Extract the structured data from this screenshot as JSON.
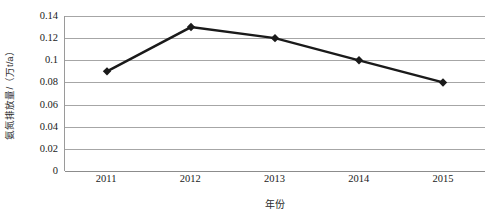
{
  "chart_data": {
    "type": "line",
    "title": "",
    "categories": [
      "2011",
      "2012",
      "2013",
      "2014",
      "2015"
    ],
    "values": [
      0.09,
      0.13,
      0.12,
      0.1,
      0.08
    ],
    "series": [
      {
        "name": "氨氮排放量",
        "values": [
          0.09,
          0.13,
          0.12,
          0.1,
          0.08
        ]
      }
    ],
    "xlabel": "年份",
    "ylabel": "氨氮排放量/（万t/a）",
    "ylim": [
      0,
      0.14
    ],
    "ytick_labels": [
      "0",
      "0.02",
      "0.04",
      "0.06",
      "0.08",
      "0.1",
      "0.12",
      "0.14"
    ],
    "ytick_values": [
      0,
      0.02,
      0.04,
      0.06,
      0.08,
      0.1,
      0.12,
      0.14
    ],
    "xtick_labels": [
      "2011",
      "2012",
      "2013",
      "2014",
      "2015"
    ],
    "grid": "horizontal",
    "legend": "none",
    "line_color": "#1a1a1a",
    "marker": "diamond",
    "marker_color": "#1a1a1a",
    "gridline_color": "#a6a6a6",
    "background_color": "#ffffff"
  }
}
